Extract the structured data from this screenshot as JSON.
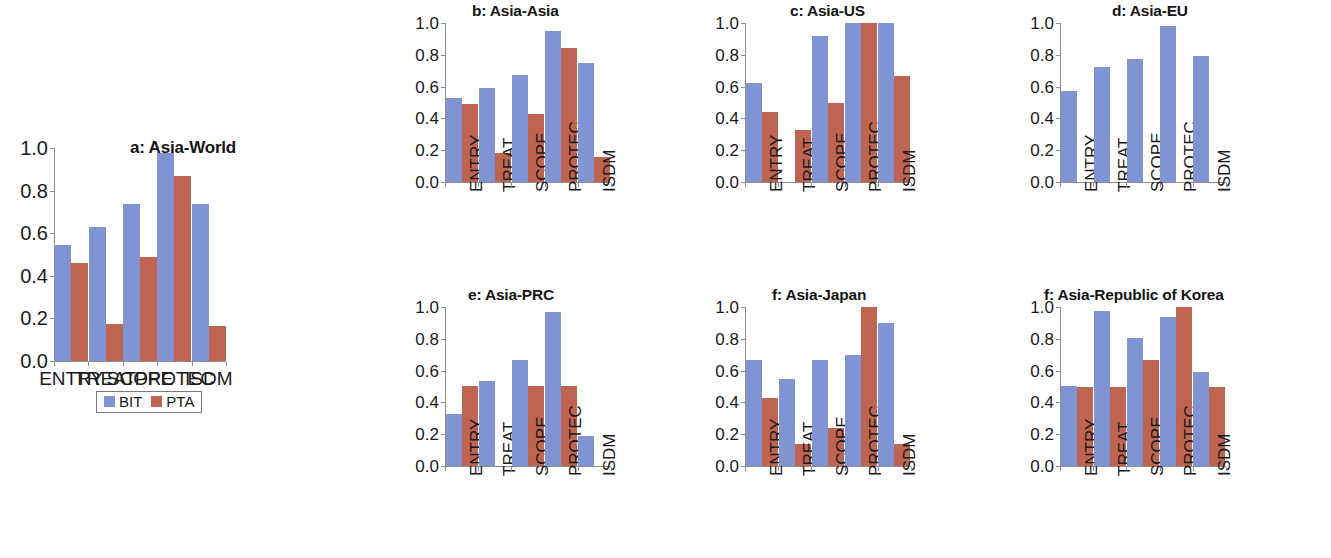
{
  "figure": {
    "background": "#ffffff",
    "colors": {
      "bit": "#8094d4",
      "pta": "#bf6450",
      "axis": "#8e8e8e",
      "text": "#1a1a1a"
    }
  },
  "legend": {
    "position": "below panel a",
    "entries": [
      {
        "key": "bit",
        "label": "BIT",
        "color": "#8094d4"
      },
      {
        "key": "pta",
        "label": "PTA",
        "color": "#bf6450"
      }
    ]
  },
  "axis": {
    "yticks": [
      "0.0",
      "0.2",
      "0.4",
      "0.6",
      "0.8",
      "1.0"
    ],
    "ylim": [
      0,
      1
    ],
    "categories": [
      "ENTRY",
      "TREAT",
      "SCOPE",
      "PROTEC",
      "ISDM"
    ]
  },
  "chart_data": [
    {
      "type": "bar",
      "panel": "a",
      "title": "a: Asia-World",
      "categories": [
        "ENTRY",
        "TREAT",
        "SCOPE",
        "PROTEC",
        "ISDM"
      ],
      "series": [
        {
          "name": "BIT",
          "values": [
            0.545,
            0.63,
            0.735,
            0.975,
            0.735
          ]
        },
        {
          "name": "PTA",
          "values": [
            0.46,
            0.175,
            0.49,
            0.87,
            0.165
          ]
        }
      ],
      "xlabel": "",
      "ylabel": "",
      "ylim": [
        0,
        1
      ],
      "yticks": [
        "0.0",
        "0.2",
        "0.4",
        "0.6",
        "0.8",
        "1.0"
      ],
      "grid": false,
      "legend_position": "bottom"
    },
    {
      "type": "bar",
      "panel": "b",
      "title": "b: Asia-Asia",
      "categories": [
        "ENTRY",
        "TREAT",
        "SCOPE",
        "PROTEC",
        "ISDM"
      ],
      "series": [
        {
          "name": "BIT",
          "values": [
            0.53,
            0.59,
            0.67,
            0.95,
            0.75
          ]
        },
        {
          "name": "PTA",
          "values": [
            0.49,
            0.185,
            0.43,
            0.845,
            0.16
          ]
        }
      ],
      "xlabel": "",
      "ylabel": "",
      "ylim": [
        0,
        1
      ],
      "yticks": [
        "0.0",
        "0.2",
        "0.4",
        "0.6",
        "0.8",
        "1.0"
      ],
      "grid": false,
      "legend_position": "none"
    },
    {
      "type": "bar",
      "panel": "c",
      "title": "c: Asia-US",
      "categories": [
        "ENTRY",
        "TREAT",
        "SCOPE",
        "PROTEC",
        "ISDM"
      ],
      "series": [
        {
          "name": "BIT",
          "values": [
            0.625,
            0.0,
            0.92,
            1.0,
            1.0
          ]
        },
        {
          "name": "PTA",
          "values": [
            0.44,
            0.33,
            0.5,
            1.0,
            0.665
          ]
        }
      ],
      "xlabel": "",
      "ylabel": "",
      "ylim": [
        0,
        1
      ],
      "yticks": [
        "0.0",
        "0.2",
        "0.4",
        "0.6",
        "0.8",
        "1.0"
      ],
      "grid": false,
      "legend_position": "none"
    },
    {
      "type": "bar",
      "panel": "d",
      "title": "d: Asia-EU",
      "categories": [
        "ENTRY",
        "TREAT",
        "SCOPE",
        "PROTEC",
        "ISDM"
      ],
      "series": [
        {
          "name": "BIT",
          "values": [
            0.57,
            0.725,
            0.775,
            0.98,
            0.79
          ]
        },
        {
          "name": "PTA",
          "values": [
            0.0,
            0.0,
            0.0,
            0.0,
            0.0
          ]
        }
      ],
      "xlabel": "",
      "ylabel": "",
      "ylim": [
        0,
        1
      ],
      "yticks": [
        "0.0",
        "0.2",
        "0.4",
        "0.6",
        "0.8",
        "1.0"
      ],
      "grid": false,
      "legend_position": "none"
    },
    {
      "type": "bar",
      "panel": "e",
      "title": "e: Asia-PRC",
      "categories": [
        "ENTRY",
        "TREAT",
        "SCOPE",
        "PROTEC",
        "ISDM"
      ],
      "series": [
        {
          "name": "BIT",
          "values": [
            0.33,
            0.535,
            0.665,
            0.97,
            0.19
          ]
        },
        {
          "name": "PTA",
          "values": [
            0.505,
            0.0,
            0.505,
            0.505,
            0.0
          ]
        }
      ],
      "xlabel": "",
      "ylabel": "",
      "ylim": [
        0,
        1
      ],
      "yticks": [
        "0.0",
        "0.2",
        "0.4",
        "0.6",
        "0.8",
        "1.0"
      ],
      "grid": false,
      "legend_position": "none"
    },
    {
      "type": "bar",
      "panel": "f",
      "title": "f: Asia-Japan",
      "categories": [
        "ENTRY",
        "TREAT",
        "SCOPE",
        "PROTEC",
        "ISDM"
      ],
      "series": [
        {
          "name": "BIT",
          "values": [
            0.665,
            0.55,
            0.665,
            0.7,
            0.9
          ]
        },
        {
          "name": "PTA",
          "values": [
            0.43,
            0.14,
            0.24,
            1.0,
            0.14
          ]
        }
      ],
      "xlabel": "",
      "ylabel": "",
      "ylim": [
        0,
        1
      ],
      "yticks": [
        "0.0",
        "0.2",
        "0.4",
        "0.6",
        "0.8",
        "1.0"
      ],
      "grid": false,
      "legend_position": "none"
    },
    {
      "type": "bar",
      "panel": "g",
      "title": "f: Asia-Republic of Korea",
      "categories": [
        "ENTRY",
        "TREAT",
        "SCOPE",
        "PROTEC",
        "ISDM"
      ],
      "series": [
        {
          "name": "BIT",
          "values": [
            0.505,
            0.975,
            0.805,
            0.94,
            0.59
          ]
        },
        {
          "name": "PTA",
          "values": [
            0.5,
            0.5,
            0.665,
            1.0,
            0.5
          ]
        }
      ],
      "xlabel": "",
      "ylabel": "",
      "ylim": [
        0,
        1
      ],
      "yticks": [
        "0.0",
        "0.2",
        "0.4",
        "0.6",
        "0.8",
        "1.0"
      ],
      "grid": false,
      "legend_position": "none"
    }
  ]
}
